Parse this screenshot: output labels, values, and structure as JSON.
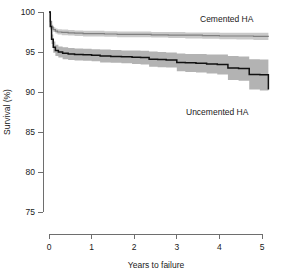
{
  "chart_data": {
    "type": "line",
    "title": "",
    "subtitle": "",
    "xlabel": "Years to failure",
    "ylabel": "Survival (%)",
    "xlim": [
      0,
      5.2
    ],
    "ylim": [
      75,
      100
    ],
    "xticks": [
      0,
      1,
      2,
      3,
      4,
      5
    ],
    "xtick_labels": [
      "0",
      "1",
      "2",
      "3",
      "4",
      "5"
    ],
    "yticks": [
      75,
      80,
      85,
      90,
      95,
      100
    ],
    "ytick_labels": [
      "75",
      "80",
      "85",
      "90",
      "95",
      "100"
    ],
    "grid": false,
    "legend_position": "inline-annotations",
    "annotations": [
      {
        "text": "Cemented HA",
        "x": 3.75,
        "y": 98.6
      },
      {
        "text": "Uncemented HA",
        "x": 3.55,
        "y": 89.2
      }
    ],
    "series": [
      {
        "name": "Cemented HA",
        "color": "#808080",
        "band_color": "#c9c9c9",
        "x": [
          0,
          0.03,
          0.06,
          0.1,
          0.15,
          0.2,
          0.3,
          0.45,
          0.6,
          0.8,
          1.0,
          1.3,
          1.6,
          2.0,
          2.4,
          2.8,
          3.2,
          3.6,
          4.0,
          4.4,
          4.8,
          5.15
        ],
        "values": [
          100.0,
          98.8,
          98.1,
          97.8,
          97.6,
          97.5,
          97.45,
          97.4,
          97.35,
          97.3,
          97.3,
          97.25,
          97.2,
          97.2,
          97.15,
          97.1,
          97.1,
          97.05,
          97.0,
          97.0,
          96.95,
          96.9
        ],
        "ci_upper": [
          100.0,
          99.0,
          98.4,
          98.1,
          97.95,
          97.85,
          97.8,
          97.75,
          97.7,
          97.65,
          97.65,
          97.6,
          97.55,
          97.55,
          97.5,
          97.5,
          97.45,
          97.45,
          97.4,
          97.4,
          97.4,
          97.35
        ],
        "ci_lower": [
          100.0,
          98.6,
          97.85,
          97.5,
          97.3,
          97.2,
          97.1,
          97.05,
          97.0,
          96.95,
          96.95,
          96.9,
          96.85,
          96.85,
          96.8,
          96.75,
          96.7,
          96.65,
          96.6,
          96.55,
          96.5,
          96.45
        ]
      },
      {
        "name": "Uncemented HA",
        "color": "#111111",
        "band_color": "#b3b3b3",
        "x": [
          0,
          0.03,
          0.06,
          0.1,
          0.15,
          0.22,
          0.32,
          0.45,
          0.6,
          0.8,
          1.0,
          1.2,
          1.45,
          1.7,
          1.95,
          2.15,
          2.35,
          2.55,
          2.75,
          3.0,
          3.2,
          3.45,
          3.7,
          3.95,
          4.2,
          4.45,
          4.7,
          4.95,
          5.15
        ],
        "values": [
          100.0,
          98.2,
          96.6,
          95.6,
          95.2,
          95.0,
          94.85,
          94.75,
          94.7,
          94.65,
          94.6,
          94.5,
          94.45,
          94.4,
          94.35,
          94.3,
          94.1,
          94.05,
          94.0,
          93.7,
          93.65,
          93.6,
          93.5,
          93.45,
          93.0,
          92.95,
          92.2,
          92.15,
          90.3
        ],
        "ci_upper": [
          100.0,
          98.6,
          97.2,
          96.3,
          95.9,
          95.7,
          95.6,
          95.5,
          95.45,
          95.4,
          95.35,
          95.3,
          95.25,
          95.2,
          95.2,
          95.15,
          95.05,
          95.0,
          94.95,
          94.8,
          94.75,
          94.75,
          94.7,
          94.7,
          94.5,
          94.45,
          94.1,
          94.05,
          93.5
        ],
        "ci_lower": [
          100.0,
          97.8,
          96.0,
          94.9,
          94.5,
          94.3,
          94.1,
          94.0,
          93.95,
          93.9,
          93.85,
          93.7,
          93.65,
          93.6,
          93.5,
          93.45,
          93.15,
          93.1,
          93.05,
          92.6,
          92.5,
          92.45,
          92.3,
          92.2,
          91.5,
          91.4,
          90.3,
          90.2,
          85.2
        ]
      }
    ]
  },
  "axes": {
    "x_title": "Years to failure",
    "y_title": "Survival (%)",
    "x_tick_labels": [
      "0",
      "1",
      "2",
      "3",
      "4",
      "5"
    ],
    "y_tick_labels": [
      "75",
      "80",
      "85",
      "90",
      "95",
      "100"
    ]
  },
  "labels": {
    "cemented": "Cemented HA",
    "uncemented": "Uncemented HA"
  },
  "colors": {
    "curve_uncemented": "#111111",
    "curve_cemented": "#808080",
    "band_uncemented": "#b3b3b3",
    "band_cemented": "#c9c9c9",
    "axis": "#6e6e6e",
    "background": "#ffffff"
  }
}
